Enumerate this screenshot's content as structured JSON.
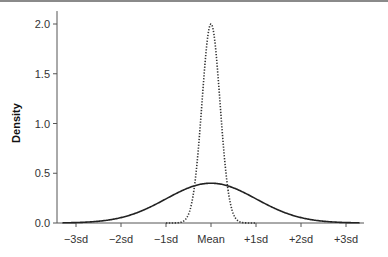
{
  "chart_data": {
    "type": "line",
    "title": "",
    "xlabel": "",
    "ylabel": "Density",
    "x_ticks": [
      "−3sd",
      "−2sd",
      "−1sd",
      "Mean",
      "+1sd",
      "+2sd",
      "+3sd"
    ],
    "y_ticks": [
      "0.0",
      "0.5",
      "1.0",
      "1.5",
      "2.0"
    ],
    "ylim": [
      0,
      2.1
    ],
    "xlim": [
      -3.4,
      3.4
    ],
    "grid": false,
    "legend": null,
    "series": [
      {
        "name": "wide normal (sd=1)",
        "style": "solid",
        "mean": 0,
        "sd": 1,
        "peak": 0.4
      },
      {
        "name": "narrow normal (sd=0.2)",
        "style": "dotted",
        "mean": 0,
        "sd": 0.2,
        "peak": 2.0
      }
    ]
  },
  "colors": {
    "line": "#222222",
    "axis": "#555555",
    "topline": "#8a8a8a"
  }
}
